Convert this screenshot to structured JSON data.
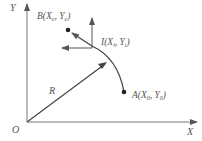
{
  "diagram": {
    "axes": {
      "x_label": "X",
      "y_label": "Y",
      "origin_label": "O"
    },
    "points": {
      "B": {
        "name": "B",
        "x_sub": "e",
        "y_sub": "e"
      },
      "I": {
        "name": "I",
        "x_sub": "i",
        "y_sub": "i"
      },
      "A": {
        "name": "A",
        "x_sub": "0",
        "y_sub": "0"
      }
    },
    "radius_label": "R",
    "colors": {
      "line": "#555555",
      "text": "#555555",
      "background": "#ffffff"
    }
  }
}
